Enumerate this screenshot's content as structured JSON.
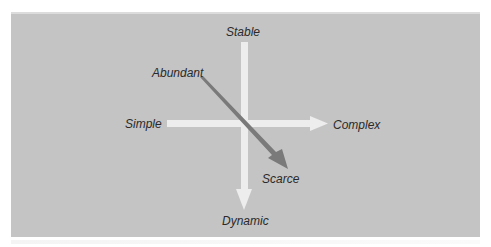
{
  "diagram": {
    "type": "two-axis environment map",
    "colors": {
      "panel_background": "#c4c4c4",
      "axis_arrows": "#ededed",
      "trend_arrow": "#7a7a7a",
      "label_text": "#2a2a2a"
    },
    "vertical_axis": {
      "top_label": "Stable",
      "bottom_label": "Dynamic",
      "direction": "down"
    },
    "horizontal_axis": {
      "left_label": "Simple",
      "right_label": "Complex",
      "direction": "right"
    },
    "diagonal_arrow": {
      "start_label": "Abundant",
      "end_label": "Scarce",
      "direction": "down-right"
    }
  }
}
